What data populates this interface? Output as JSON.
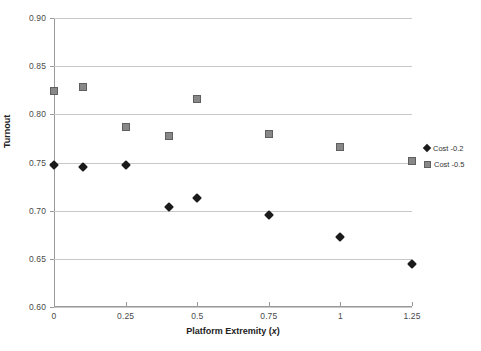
{
  "chart_data": {
    "type": "scatter",
    "title": "",
    "xlabel": "Platform Extremity (x)",
    "ylabel": "Turnout",
    "xlim": [
      0,
      1.25
    ],
    "ylim": [
      0.6,
      0.9
    ],
    "grid": true,
    "legend_position": "right",
    "x_ticks": [
      "0",
      "0.25",
      "0.5",
      "0.75",
      "1",
      "1.25"
    ],
    "x_tick_values": [
      0,
      0.25,
      0.5,
      0.75,
      1,
      1.25
    ],
    "y_ticks": [
      "0.60",
      "0.65",
      "0.70",
      "0.75",
      "0.80",
      "0.85",
      "0.90"
    ],
    "y_tick_values": [
      0.6,
      0.65,
      0.7,
      0.75,
      0.8,
      0.85,
      0.9
    ],
    "series": [
      {
        "name": "Cost -0.2",
        "marker": "diamond",
        "color": "#1a1a1a",
        "x": [
          0,
          0.1,
          0.25,
          0.4,
          0.5,
          0.75,
          1.0,
          1.25
        ],
        "values": [
          0.747,
          0.745,
          0.747,
          0.704,
          0.713,
          0.696,
          0.673,
          0.645
        ]
      },
      {
        "name": "Cost -0.5",
        "marker": "square",
        "color": "#888888",
        "x": [
          0,
          0.1,
          0.25,
          0.4,
          0.5,
          0.75,
          1.0,
          1.25
        ],
        "values": [
          0.824,
          0.828,
          0.787,
          0.777,
          0.816,
          0.78,
          0.766,
          0.752
        ]
      }
    ]
  },
  "axis": {
    "y_title": "Turnout",
    "x_title_main": "Platform Extremity (",
    "x_title_var": "x",
    "x_title_end": ")"
  },
  "legend": {
    "items": [
      {
        "label": "Cost -0.2"
      },
      {
        "label": "Cost -0.5"
      }
    ]
  }
}
